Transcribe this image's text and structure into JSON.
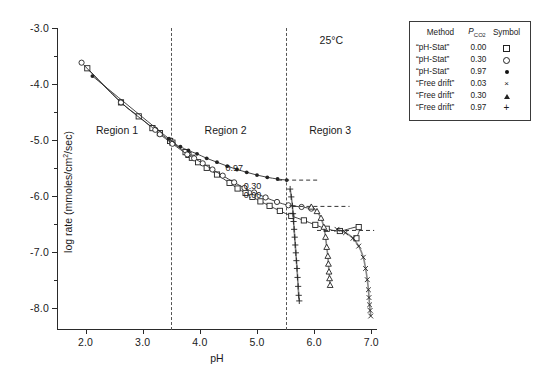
{
  "chart_data": {
    "type": "scatter",
    "title": "",
    "annotation_temperature": "25°C",
    "xlabel": "pH",
    "ylabel": "log rate (mmoles/cm²/sec)",
    "xlim": [
      1.5,
      7.1
    ],
    "ylim": [
      -8.4,
      -3.0
    ],
    "grid": false,
    "xticks": [
      2.0,
      3.0,
      4.0,
      5.0,
      6.0,
      7.0
    ],
    "xticklabels": [
      "2.0",
      "3.0",
      "4.0",
      "5.0",
      "6.0",
      "7.0"
    ],
    "yticks": [
      -3.0,
      -4.0,
      -5.0,
      -6.0,
      -7.0,
      -8.0
    ],
    "yticklabels": [
      "-3.0",
      "-4.0",
      "-5.0",
      "-6.0",
      "-7.0",
      "-8.0"
    ],
    "yminorticks": [
      -3.5,
      -4.5,
      -5.5,
      -6.5,
      -7.5
    ],
    "region_dividers": [
      3.5,
      5.5
    ],
    "region_labels": [
      {
        "text": "Region 1",
        "x": 2.55,
        "y": -4.82
      },
      {
        "text": "Region 2",
        "x": 4.45,
        "y": -4.82
      },
      {
        "text": "Region 3",
        "x": 6.28,
        "y": -4.82
      }
    ],
    "curve_labels": [
      {
        "text": "0.97",
        "x": 4.6,
        "y": -5.5
      },
      {
        "text": "0.30",
        "x": 4.92,
        "y": -5.83
      },
      {
        "text": "0.00",
        "x": 4.92,
        "y": -5.98
      }
    ],
    "asymptotes": [
      {
        "pco2": "0.97",
        "y": -5.72,
        "x_start": 5.37,
        "x_end": 6.1
      },
      {
        "pco2": "0.30",
        "y": -6.19,
        "x_start": 5.62,
        "x_end": 6.62
      },
      {
        "pco2": "0.00",
        "y": -6.62,
        "x_start": 6.05,
        "x_end": 7.05
      }
    ],
    "series": [
      {
        "name": "“pH-Stat” 0.00",
        "method": "“pH-Stat”",
        "pco2": "0.00",
        "symbol": "open-square",
        "points": [
          [
            2.03,
            -3.72
          ],
          [
            2.62,
            -4.33
          ],
          [
            2.93,
            -4.58
          ],
          [
            3.17,
            -4.79
          ],
          [
            3.3,
            -4.88
          ],
          [
            3.48,
            -5.02
          ],
          [
            3.52,
            -5.05
          ],
          [
            3.75,
            -5.22
          ],
          [
            3.8,
            -5.27
          ],
          [
            3.86,
            -5.32
          ],
          [
            3.97,
            -5.4
          ],
          [
            4.12,
            -5.5
          ],
          [
            4.3,
            -5.62
          ],
          [
            4.52,
            -5.77
          ],
          [
            4.66,
            -5.87
          ],
          [
            4.8,
            -5.95
          ],
          [
            4.92,
            -6.02
          ],
          [
            5.06,
            -6.1
          ],
          [
            5.22,
            -6.18
          ],
          [
            5.4,
            -6.27
          ],
          [
            5.6,
            -6.36
          ],
          [
            5.82,
            -6.44
          ],
          [
            6.02,
            -6.52
          ],
          [
            6.22,
            -6.59
          ],
          [
            6.45,
            -6.63
          ],
          [
            6.78,
            -6.56
          ],
          [
            6.74,
            -6.76
          ]
        ]
      },
      {
        "name": "“pH-Stat” 0.30",
        "method": "“pH-Stat”",
        "pco2": "0.30",
        "symbol": "open-circle",
        "points": [
          [
            1.93,
            -3.62
          ],
          [
            2.62,
            -4.33
          ],
          [
            3.22,
            -4.82
          ],
          [
            3.3,
            -4.9
          ],
          [
            3.52,
            -5.07
          ],
          [
            3.78,
            -5.26
          ],
          [
            3.9,
            -5.33
          ],
          [
            4.05,
            -5.42
          ],
          [
            4.22,
            -5.53
          ],
          [
            4.4,
            -5.64
          ],
          [
            4.6,
            -5.76
          ],
          [
            4.78,
            -5.86
          ],
          [
            4.95,
            -5.94
          ],
          [
            5.15,
            -6.03
          ],
          [
            5.35,
            -6.11
          ],
          [
            5.55,
            -6.17
          ],
          [
            5.78,
            -6.2
          ],
          [
            5.95,
            -6.23
          ]
        ]
      },
      {
        "name": "“pH-Stat” 0.97",
        "method": "“pH-Stat”",
        "pco2": "0.97",
        "symbol": "filled-circle",
        "points": [
          [
            2.12,
            -3.86
          ],
          [
            3.46,
            -4.98
          ],
          [
            3.66,
            -5.12
          ],
          [
            3.8,
            -5.19
          ],
          [
            3.95,
            -5.25
          ],
          [
            4.12,
            -5.33
          ],
          [
            4.3,
            -5.4
          ],
          [
            4.48,
            -5.47
          ],
          [
            4.65,
            -5.53
          ],
          [
            4.82,
            -5.58
          ],
          [
            5.0,
            -5.63
          ],
          [
            5.18,
            -5.67
          ],
          [
            5.36,
            -5.7
          ],
          [
            5.52,
            -5.72
          ]
        ]
      },
      {
        "name": "“Free drift” 0.03",
        "method": "“Free drift”",
        "pco2": "0.03",
        "symbol": "cross-x",
        "points": [
          [
            6.4,
            -6.6
          ],
          [
            6.55,
            -6.66
          ],
          [
            6.68,
            -6.76
          ],
          [
            6.78,
            -6.9
          ],
          [
            6.86,
            -7.1
          ],
          [
            6.9,
            -7.3
          ],
          [
            6.93,
            -7.5
          ],
          [
            6.95,
            -7.68
          ],
          [
            6.96,
            -7.82
          ],
          [
            6.97,
            -7.95
          ],
          [
            6.98,
            -8.05
          ],
          [
            6.99,
            -8.15
          ]
        ]
      },
      {
        "name": "“Free drift” 0.30",
        "method": "“Free drift”",
        "pco2": "0.30",
        "symbol": "open-triangle",
        "points": [
          [
            5.95,
            -6.2
          ],
          [
            6.05,
            -6.28
          ],
          [
            6.12,
            -6.4
          ],
          [
            6.17,
            -6.56
          ],
          [
            6.2,
            -6.74
          ],
          [
            6.22,
            -6.92
          ],
          [
            6.24,
            -7.08
          ],
          [
            6.25,
            -7.22
          ],
          [
            6.26,
            -7.36
          ],
          [
            6.27,
            -7.48
          ],
          [
            6.28,
            -7.6
          ]
        ]
      },
      {
        "name": "“Free drift” 0.97",
        "method": "“Free drift”",
        "pco2": "0.97",
        "symbol": "plus",
        "points": [
          [
            5.58,
            -5.88
          ],
          [
            5.6,
            -6.02
          ],
          [
            5.62,
            -6.18
          ],
          [
            5.63,
            -6.32
          ],
          [
            5.64,
            -6.46
          ],
          [
            5.65,
            -6.6
          ],
          [
            5.66,
            -6.74
          ],
          [
            5.67,
            -6.88
          ],
          [
            5.68,
            -7.02
          ],
          [
            5.69,
            -7.16
          ],
          [
            5.7,
            -7.3
          ],
          [
            5.71,
            -7.46
          ],
          [
            5.72,
            -7.62
          ],
          [
            5.73,
            -7.78
          ],
          [
            5.74,
            -7.88
          ]
        ]
      }
    ]
  },
  "legend": {
    "headers": {
      "method": "Method",
      "pco2_main": "P",
      "pco2_sub": "CO",
      "pco2_sub2": "2",
      "symbol": "Symbol"
    },
    "rows": [
      {
        "method": "“pH-Stat”",
        "pco2": "0.00",
        "symbol": "open-square"
      },
      {
        "method": "“pH-Stat”",
        "pco2": "0.30",
        "symbol": "open-circle"
      },
      {
        "method": "“pH-Stat”",
        "pco2": "0.97",
        "symbol": "filled-circle"
      },
      {
        "method": "“Free drift”",
        "pco2": "0.03",
        "symbol": "cross-x"
      },
      {
        "method": "“Free drift”",
        "pco2": "0.30",
        "symbol": "open-triangle"
      },
      {
        "method": "“Free drift”",
        "pco2": "0.97",
        "symbol": "plus"
      }
    ]
  },
  "colors": {
    "axis": "#2a2a2a",
    "marker": "#222222",
    "dashed": "#555555",
    "background": "#ffffff"
  }
}
